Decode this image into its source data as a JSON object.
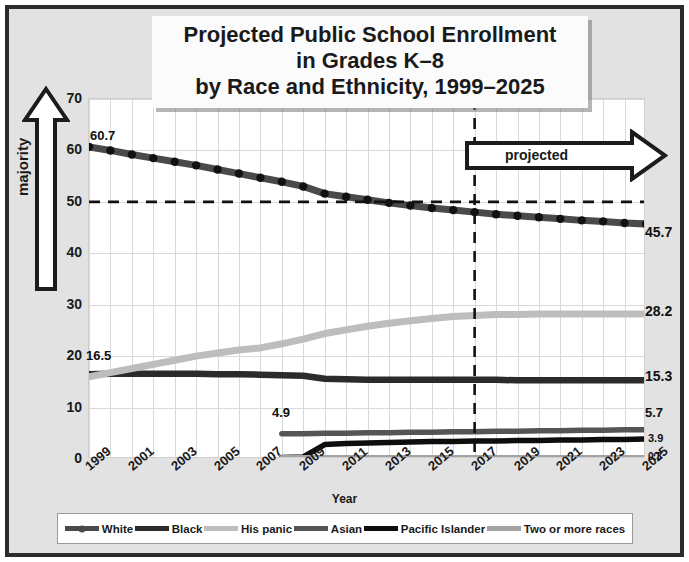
{
  "title": {
    "line1": "Projected Public School Enrollment",
    "line2": "in Grades K–8",
    "line3": "by Race and Ethnicity, 1999–2025"
  },
  "annotations": {
    "majority": "majority",
    "projected": "projected",
    "projected_start_year": 2017,
    "majority_threshold": 50
  },
  "end_labels": {
    "white": "45.7",
    "hispanic": "28.2",
    "black": "15.3",
    "asian": "5.7",
    "pacific_islander": "3.9",
    "two_or_more": "0.3"
  },
  "start_labels": {
    "white": "60.7",
    "black": "16.5",
    "asian": "4.9"
  },
  "colors": {
    "white": "#4a4a4a",
    "black": "#2b2b2b",
    "hispanic": "#b8b8b8",
    "asian": "#555555",
    "pacific_islander": "#0d0d0d",
    "two_or_more": "#9e9e9e",
    "frame": "#2b2b2b",
    "panel_bg": "#e2e2e2",
    "grid": "#d9d9d9"
  },
  "chart_data": {
    "type": "line",
    "title": "Projected Public School Enrollment in Grades K–8 by Race and Ethnicity, 1999–2025",
    "xlabel": "Year",
    "ylabel": "Percent",
    "xlim": [
      1999,
      2025
    ],
    "ylim": [
      0,
      70
    ],
    "yticks": [
      0,
      10,
      20,
      30,
      40,
      50,
      60,
      70
    ],
    "xticks": [
      1999,
      2001,
      2003,
      2005,
      2007,
      2009,
      2011,
      2013,
      2015,
      2017,
      2019,
      2021,
      2023,
      2025
    ],
    "grid": true,
    "legend_position": "bottom",
    "reference_lines": [
      {
        "type": "horizontal",
        "value": 50,
        "style": "dashed",
        "label": "majority"
      },
      {
        "type": "vertical",
        "value": 2017,
        "style": "dashed",
        "label": "projected"
      }
    ],
    "x": [
      1999,
      2000,
      2001,
      2002,
      2003,
      2004,
      2005,
      2006,
      2007,
      2008,
      2009,
      2010,
      2011,
      2012,
      2013,
      2014,
      2015,
      2016,
      2017,
      2018,
      2019,
      2020,
      2021,
      2022,
      2023,
      2024,
      2025
    ],
    "series": [
      {
        "name": "White",
        "marker": "circle",
        "values": [
          60.7,
          60.0,
          59.2,
          58.5,
          57.8,
          57.1,
          56.3,
          55.5,
          54.7,
          53.9,
          53.0,
          51.6,
          51.0,
          50.4,
          49.8,
          49.3,
          48.8,
          48.4,
          48.0,
          47.6,
          47.3,
          47.0,
          46.7,
          46.4,
          46.2,
          45.9,
          45.7
        ]
      },
      {
        "name": "Black",
        "marker": "none",
        "values": [
          16.5,
          16.6,
          16.6,
          16.6,
          16.6,
          16.6,
          16.5,
          16.5,
          16.4,
          16.3,
          16.2,
          15.6,
          15.5,
          15.4,
          15.4,
          15.4,
          15.4,
          15.4,
          15.4,
          15.4,
          15.3,
          15.3,
          15.3,
          15.3,
          15.3,
          15.3,
          15.3
        ]
      },
      {
        "name": "His panic",
        "marker": "none",
        "values": [
          16.0,
          16.8,
          17.6,
          18.4,
          19.2,
          20.0,
          20.6,
          21.2,
          21.6,
          22.4,
          23.3,
          24.4,
          25.1,
          25.8,
          26.4,
          26.9,
          27.3,
          27.7,
          27.9,
          28.1,
          28.1,
          28.2,
          28.2,
          28.2,
          28.2,
          28.2,
          28.2
        ]
      },
      {
        "name": "Asian",
        "marker": "none",
        "values": [
          null,
          null,
          null,
          null,
          null,
          null,
          null,
          null,
          null,
          4.9,
          4.9,
          5.0,
          5.0,
          5.1,
          5.1,
          5.2,
          5.2,
          5.3,
          5.3,
          5.4,
          5.4,
          5.5,
          5.5,
          5.6,
          5.6,
          5.7,
          5.7
        ]
      },
      {
        "name": "Pacific Islander",
        "marker": "none",
        "values": [
          null,
          null,
          null,
          null,
          null,
          null,
          null,
          null,
          null,
          0.3,
          0.4,
          2.8,
          3.0,
          3.1,
          3.2,
          3.3,
          3.4,
          3.4,
          3.5,
          3.5,
          3.6,
          3.6,
          3.7,
          3.7,
          3.8,
          3.8,
          3.9
        ]
      },
      {
        "name": "Two or more races",
        "marker": "none",
        "values": [
          null,
          null,
          null,
          null,
          null,
          null,
          null,
          null,
          null,
          0.3,
          0.3,
          0.3,
          0.3,
          0.3,
          0.3,
          0.3,
          0.3,
          0.3,
          0.3,
          0.3,
          0.3,
          0.3,
          0.3,
          0.3,
          0.3,
          0.3,
          0.3
        ]
      }
    ]
  },
  "legend": [
    {
      "label": "White",
      "color": "#4a4a4a",
      "marker": true
    },
    {
      "label": "Black",
      "color": "#2b2b2b",
      "marker": false
    },
    {
      "label": "His panic",
      "color": "#bdbdbd",
      "marker": false
    },
    {
      "label": "Asian",
      "color": "#555555",
      "marker": false
    },
    {
      "label": "Pacific Islander",
      "color": "#0d0d0d",
      "marker": false
    },
    {
      "label": "Two or more races",
      "color": "#a3a3a3",
      "marker": false
    }
  ]
}
